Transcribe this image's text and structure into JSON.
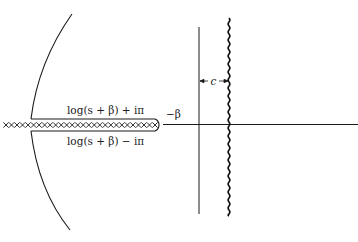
{
  "diagram": {
    "type": "complex-plane contour diagram",
    "labels": {
      "upper_branch": "log(s + β) + iπ",
      "lower_branch": "log(s + β) − iπ",
      "branch_point": "−β",
      "separation": "c"
    },
    "elements": {
      "cut_marker": "×",
      "cut_count": 28
    },
    "colors": {
      "ink": "#1a1a1a",
      "background": "#ffffff"
    }
  }
}
